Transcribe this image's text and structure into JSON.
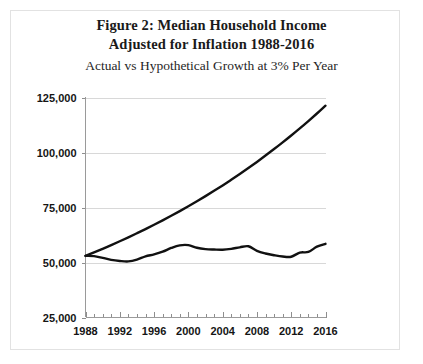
{
  "figure": {
    "title_line_1": "Figure 2: Median Household Income",
    "title_line_2": "Adjusted for Inflation 1988-2016",
    "subtitle": "Actual vs Hypothetical Growth at 3% Per Year"
  },
  "chart_data": {
    "type": "line",
    "title": "Figure 2: Median Household Income Adjusted for Inflation 1988-2016",
    "subtitle": "Actual vs Hypothetical Growth at 3% Per Year",
    "xlabel": "",
    "ylabel": "",
    "xlim": [
      1988,
      2016
    ],
    "ylim": [
      25000,
      125000
    ],
    "grid": true,
    "legend": "none",
    "y_ticks": [
      25000,
      50000,
      75000,
      100000,
      125000
    ],
    "y_tick_labels": [
      "25,000",
      "50,000",
      "75,000",
      "100,000",
      "125,000"
    ],
    "x_ticks": [
      1988,
      1992,
      1996,
      2000,
      2004,
      2008,
      2012,
      2016
    ],
    "x_tick_labels": [
      "1988",
      "1992",
      "1996",
      "2000",
      "2004",
      "2008",
      "2012",
      "2016"
    ],
    "x_minor_tick_interval": 1,
    "x": [
      1988,
      1989,
      1990,
      1991,
      1992,
      1993,
      1994,
      1995,
      1996,
      1997,
      1998,
      1999,
      2000,
      2001,
      2002,
      2003,
      2004,
      2005,
      2006,
      2007,
      2008,
      2009,
      2010,
      2011,
      2012,
      2013,
      2014,
      2015,
      2016
    ],
    "series": [
      {
        "name": "Hypothetical Growth at 3% Per Year",
        "color": "#111111",
        "values": [
          53000,
          54590,
          56228,
          57915,
          59652,
          61442,
          63285,
          65184,
          67139,
          69153,
          71228,
          73365,
          75566,
          77833,
          80168,
          82573,
          85050,
          87602,
          90230,
          92937,
          95725,
          98596,
          101554,
          104601,
          107739,
          110971,
          114300,
          117729,
          121261
        ]
      },
      {
        "name": "Actual Median Household Income",
        "color": "#111111",
        "values": [
          53000,
          52900,
          52100,
          51200,
          50700,
          50500,
          51300,
          52800,
          53700,
          54900,
          56600,
          57800,
          57900,
          56700,
          56100,
          55900,
          55800,
          56200,
          56900,
          57400,
          55300,
          54100,
          53300,
          52700,
          52600,
          54500,
          54800,
          57200,
          58500
        ]
      }
    ],
    "annotations": []
  }
}
